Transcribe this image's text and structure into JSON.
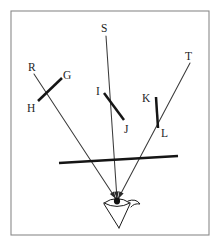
{
  "figure": {
    "width": 221,
    "height": 247,
    "background_color": "#ffffff",
    "frame": {
      "name": "figure-border",
      "x": 11,
      "y": 11,
      "width": 198,
      "height": 224,
      "stroke_color": "#8a8a8a"
    },
    "colors": {
      "ray": "#3b3b3b",
      "mirror": "#151515",
      "eye": "#1a1a1a",
      "frame": "#8a8a8a",
      "label": "#242424"
    },
    "labels": [
      {
        "id": "R",
        "text": "R",
        "x": 28,
        "y": 62,
        "name": "label-R"
      },
      {
        "id": "G",
        "text": "G",
        "x": 63,
        "y": 70,
        "name": "label-G"
      },
      {
        "id": "H",
        "text": "H",
        "x": 27,
        "y": 103,
        "name": "label-H"
      },
      {
        "id": "S",
        "text": "S",
        "x": 101,
        "y": 23,
        "name": "label-S"
      },
      {
        "id": "I",
        "text": "I",
        "x": 96,
        "y": 86,
        "name": "label-I"
      },
      {
        "id": "J",
        "text": "J",
        "x": 124,
        "y": 124,
        "name": "label-J"
      },
      {
        "id": "K",
        "text": "K",
        "x": 142,
        "y": 93,
        "name": "label-K"
      },
      {
        "id": "L",
        "text": "L",
        "x": 161,
        "y": 128,
        "name": "label-L"
      },
      {
        "id": "T",
        "text": "T",
        "x": 185,
        "y": 51,
        "name": "label-T"
      }
    ],
    "rays": [
      {
        "name": "ray-R-to-eye",
        "from": "R",
        "x1": 34,
        "y1": 74,
        "x2": 116,
        "y2": 199
      },
      {
        "name": "ray-S-to-eye",
        "x1": 106,
        "y1": 36,
        "x2": 117,
        "y2": 199
      },
      {
        "name": "ray-T-to-eye",
        "x1": 190,
        "y1": 63,
        "x2": 118,
        "y2": 199
      }
    ],
    "mirror_segments": [
      {
        "name": "mirror-segment-GH",
        "label_start": "G",
        "label_end": "H",
        "x1": 62,
        "y1": 78,
        "x2": 38,
        "y2": 101
      },
      {
        "name": "mirror-segment-IJ",
        "label_start": "I",
        "label_end": "J",
        "x1": 104,
        "y1": 93,
        "x2": 124,
        "y2": 120
      },
      {
        "name": "mirror-segment-KL",
        "label_start": "K",
        "label_end": "L",
        "x1": 156,
        "y1": 97,
        "x2": 158,
        "y2": 128
      }
    ],
    "mirror_plane": {
      "name": "mirror-plane-line",
      "x1": 59,
      "y1": 163,
      "x2": 178,
      "y2": 156
    },
    "eye": {
      "name": "eye-symbol",
      "center_x": 117,
      "center_y": 202,
      "pupil_x": 117,
      "pupil_y": 201
    }
  }
}
